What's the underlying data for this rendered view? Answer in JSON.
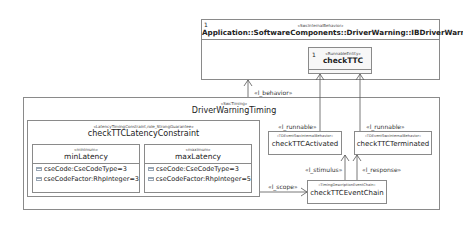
{
  "behavior_box": {
    "multiplicity": "1",
    "stereotype": "«SwcInternalBehavior»",
    "name": "Application::SoftwareComponents::DriverWarning::IBDriverWarning",
    "runnable": {
      "multiplicity": "1",
      "stereotype": "«RunnableEntity»",
      "name": "checkTTC"
    }
  },
  "timing_box": {
    "stereotype": "«SwcTiming»",
    "name": "DriverWarningTiming",
    "constraint": {
      "stereotype": "«LatencyTimingConstraint,role_StrongGuarantee»",
      "name": "checkTTCLatencyConstraint",
      "min": {
        "stereotype": "«minimum»",
        "name": "minLatency",
        "attributes": [
          "cseCode:CseCodeType=3",
          "cseCodeFactor:RhpInteger=3"
        ]
      },
      "max": {
        "stereotype": "«maximum»",
        "name": "maxLatency",
        "attributes": [
          "cseCode:CseCodeType=3",
          "cseCodeFactor:RhpInteger=5"
        ]
      }
    },
    "activated": {
      "stereotype": "«TDEventSwcInternalBehavior»",
      "name": "checkTTCActivated"
    },
    "terminated": {
      "stereotype": "«TDEventSwcInternalBehavior»",
      "name": "checkTTCTerminated"
    },
    "event_chain": {
      "stereotype": "«TimingDescriptionEventChain»",
      "name": "checkTTCEventChain"
    }
  },
  "relations": {
    "behavior": "«l_behavior»",
    "runnable_1": "«l_runnable»",
    "runnable_2": "«l_runnable»",
    "stimulus": "«l_stimulus»",
    "response": "«l_response»",
    "scope": "«l_scope»"
  }
}
